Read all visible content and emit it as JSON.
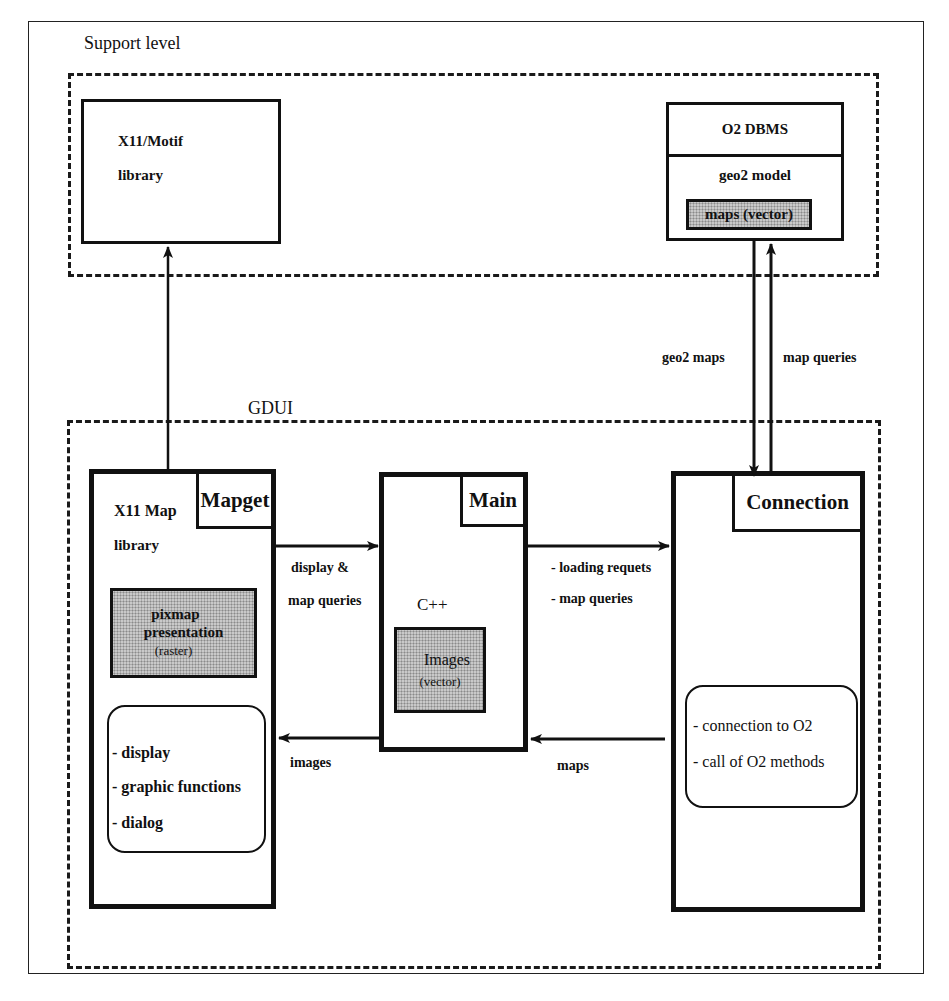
{
  "diagram": {
    "support_level": {
      "label": "Support level",
      "x11_motif": {
        "line1": "X11/Motif",
        "line2": "library"
      },
      "o2_dbms": {
        "title": "O2 DBMS",
        "model": "geo2 model",
        "shaded_item": "maps (vector)"
      }
    },
    "gdui": {
      "label": "GDUI",
      "mapget": {
        "tab": "Mapget",
        "line1": "X11 Map",
        "line2": "library",
        "shaded": {
          "line1": "pixmap",
          "line2": "presentation",
          "line3": "(raster)"
        },
        "functions": [
          "- display",
          "- graphic functions",
          "- dialog"
        ]
      },
      "main": {
        "tab": "Main",
        "language": "C++",
        "shaded": {
          "line1": "Images",
          "line2": "(vector)"
        }
      },
      "connection": {
        "tab": "Connection",
        "functions": [
          "- connection to O2",
          "- call of O2 methods"
        ]
      }
    },
    "edges": {
      "mapget_to_main": {
        "line1": "display &",
        "line2": "map queries"
      },
      "main_to_mapget": "images",
      "main_to_connection": [
        "- loading requets",
        "- map queries"
      ],
      "connection_to_main": "maps",
      "o2_to_connection": "geo2 maps",
      "connection_to_o2": "map queries"
    }
  }
}
